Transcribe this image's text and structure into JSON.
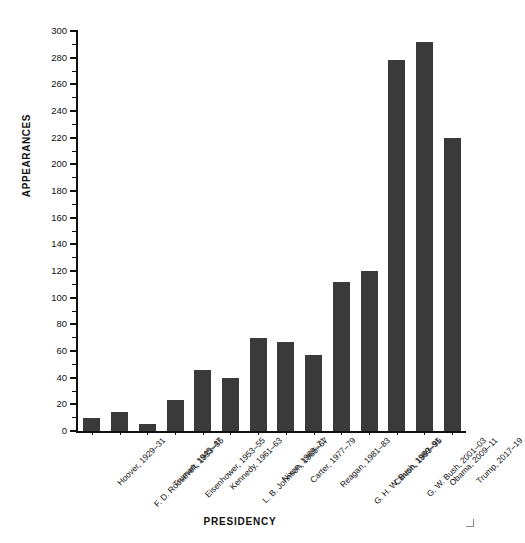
{
  "chart_data": {
    "type": "bar",
    "title": "",
    "xlabel": "PRESIDENCY",
    "ylabel": "APPEARANCES",
    "ylim": [
      0,
      300
    ],
    "ytick_step": 20,
    "yminor_step": 10,
    "grid": false,
    "legend": null,
    "bar_color": "#3a3a3a",
    "axis_color": "#111111",
    "categories": [
      "Hoover, 1929–31",
      "F. D. Roosevelt, 1933–35",
      "Truman, 1945–47",
      "Eisenhower, 1953–55",
      "Kennedy, 1961–63",
      "L. B. Johnson, 1965–67",
      "Nixon, 1969–71",
      "Carter, 1977–79",
      "Reagan, 1981–83",
      "G. H. W. Bush, 1989–91",
      "Clinton, 1993–95",
      "G. W. Bush, 2001–03",
      "Obama, 2009–11",
      "Trump, 2017–19"
    ],
    "values": [
      10,
      14,
      5,
      23,
      46,
      40,
      70,
      67,
      57,
      112,
      120,
      278,
      292,
      220
    ],
    "ytick_labels": [
      "0",
      "20",
      "40",
      "60",
      "80",
      "100",
      "120",
      "140",
      "160",
      "180",
      "200",
      "220",
      "240",
      "260",
      "280",
      "300"
    ]
  }
}
